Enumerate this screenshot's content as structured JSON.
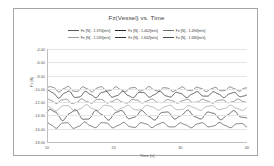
{
  "chart_data": {
    "type": "line",
    "title": "Fz(Vessel) vs. Time",
    "xlabel": "Time [s]",
    "ylabel": "Fz [N]",
    "xlim": [
      10,
      40
    ],
    "ylim": [
      -18,
      -4
    ],
    "xticks": [
      "10",
      "20",
      "30",
      "40"
    ],
    "yticks": [
      "-4.00",
      "-6.00",
      "-8.00",
      "-10.00",
      "-12.00",
      "-14.00",
      "-16.00",
      "-18.00"
    ],
    "ytick_values": [
      -4,
      -6,
      -8,
      -10,
      -12,
      -14,
      -16,
      -18
    ],
    "grid": true,
    "legend_position": "top-center",
    "series": [
      {
        "name": "Fz [N] - 1.370[m/s]",
        "color": "#595959",
        "mean": -10.05,
        "amplitude": 0.26,
        "period": 2.45,
        "phase": 0.0
      },
      {
        "name": "Fz [N] - 1.402[m/s]",
        "color": "#262626",
        "mean": -10.85,
        "amplitude": 0.34,
        "period": 2.75,
        "phase": 0.7
      },
      {
        "name": "Fz [N] - 1.490[m/s]",
        "color": "#6e6e6e",
        "mean": -11.85,
        "amplitude": 0.22,
        "period": 2.6,
        "phase": 1.4
      },
      {
        "name": "Fz [N] - 1.535[m/s]",
        "color": "#9c9c9c",
        "mean": -12.85,
        "amplitude": 0.3,
        "period": 3.1,
        "phase": 2.2
      },
      {
        "name": "Fz [N] - 1.602[m/s]",
        "color": "#303030",
        "mean": -13.95,
        "amplitude": 0.52,
        "period": 3.4,
        "phase": 0.3
      },
      {
        "name": "Fz [N] - 1.680[m/s]",
        "color": "#4a4a4a",
        "mean": -15.45,
        "amplitude": 0.3,
        "period": 2.9,
        "phase": 1.9
      }
    ]
  },
  "legend_rows": [
    [
      "Fz [N] - 1.370[m/s]",
      "Fz [N] - 1.402[m/s]",
      "Fz [N] - 1.490[m/s]"
    ],
    [
      "Fz [N] - 1.535[m/s]",
      "Fz [N] - 1.602[m/s]",
      "Fz [N] - 1.680[m/s]"
    ]
  ]
}
